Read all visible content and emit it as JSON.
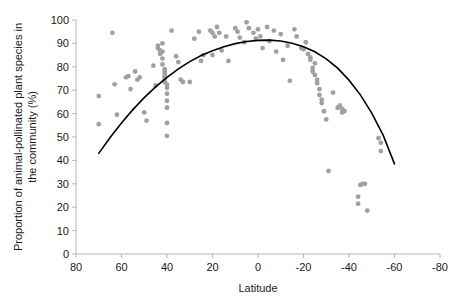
{
  "chart_data": {
    "type": "scatter",
    "title": "",
    "xlabel": "Latitude",
    "ylabel": "Proportion of animal-pollinated plant species in the community (%)",
    "ylabel_line1": "Proportion of animal-pollinated plant species in",
    "ylabel_line2": "the community (%)",
    "xlim": [
      80,
      -80
    ],
    "ylim": [
      0,
      100
    ],
    "xticks": [
      80,
      60,
      40,
      20,
      0,
      -20,
      -40,
      -60,
      -80
    ],
    "xtick_labels": [
      "80",
      "60",
      "40",
      "20",
      "0",
      "-20",
      "-40",
      "-60",
      "-80"
    ],
    "yticks": [
      0,
      10,
      20,
      30,
      40,
      50,
      60,
      70,
      80,
      90,
      100
    ],
    "ytick_labels": [
      "0",
      "10",
      "20",
      "30",
      "40",
      "50",
      "60",
      "70",
      "80",
      "90",
      "100"
    ],
    "grid": false,
    "legend": "none",
    "point_color": "#a0a0a0",
    "point_radius": 2.4,
    "axis_color": "#b5b5b5",
    "fit_color": "#000000",
    "fit_width": 1.6,
    "fit_type": "quadratic",
    "fit_note": "Fitted quadratic curve peaking near latitude 0 at about 93%",
    "fit_curve": [
      [
        70,
        43.0
      ],
      [
        65,
        49.8
      ],
      [
        60,
        56.0
      ],
      [
        55,
        61.7
      ],
      [
        50,
        66.8
      ],
      [
        45,
        71.4
      ],
      [
        40,
        75.5
      ],
      [
        35,
        79.1
      ],
      [
        30,
        82.2
      ],
      [
        25,
        84.8
      ],
      [
        20,
        86.9
      ],
      [
        15,
        88.6
      ],
      [
        10,
        89.9
      ],
      [
        5,
        90.8
      ],
      [
        0,
        91.3
      ],
      [
        -5,
        91.4
      ],
      [
        -10,
        91.0
      ],
      [
        -15,
        90.1
      ],
      [
        -20,
        88.6
      ],
      [
        -25,
        86.4
      ],
      [
        -30,
        83.4
      ],
      [
        -35,
        79.4
      ],
      [
        -40,
        74.3
      ],
      [
        -45,
        68.0
      ],
      [
        -50,
        60.2
      ],
      [
        -55,
        50.8
      ],
      [
        -60,
        38.5
      ]
    ],
    "series": [
      {
        "name": "Plant communities",
        "points": [
          [
            70,
            67.5
          ],
          [
            70,
            55.5
          ],
          [
            64,
            94.5
          ],
          [
            63,
            72.5
          ],
          [
            62,
            59.5
          ],
          [
            58,
            75.5
          ],
          [
            57,
            76.0
          ],
          [
            56,
            70.5
          ],
          [
            54,
            78.0
          ],
          [
            53,
            74.5
          ],
          [
            52,
            75.5
          ],
          [
            50,
            60.5
          ],
          [
            49,
            57.0
          ],
          [
            46,
            80.5
          ],
          [
            45,
            72.0
          ],
          [
            44,
            89.0
          ],
          [
            44,
            88.0
          ],
          [
            43,
            87.0
          ],
          [
            43,
            85.5
          ],
          [
            42,
            90.0
          ],
          [
            42,
            86.5
          ],
          [
            42,
            83.5
          ],
          [
            42,
            81.0
          ],
          [
            41,
            79.0
          ],
          [
            41,
            78.0
          ],
          [
            41,
            77.0
          ],
          [
            41,
            76.0
          ],
          [
            41,
            75.5
          ],
          [
            41,
            74.5
          ],
          [
            41,
            73.5
          ],
          [
            40,
            72.5
          ],
          [
            40,
            71.0
          ],
          [
            40,
            68.5
          ],
          [
            40,
            65.5
          ],
          [
            40,
            62.5
          ],
          [
            40,
            56.0
          ],
          [
            40,
            50.5
          ],
          [
            38,
            95.5
          ],
          [
            36,
            84.5
          ],
          [
            35,
            82.0
          ],
          [
            34,
            74.5
          ],
          [
            33,
            73.5
          ],
          [
            30,
            73.5
          ],
          [
            28,
            92.0
          ],
          [
            26,
            95.0
          ],
          [
            25,
            82.5
          ],
          [
            24,
            85.0
          ],
          [
            21,
            95.5
          ],
          [
            20,
            94.5
          ],
          [
            20,
            85.0
          ],
          [
            19,
            93.0
          ],
          [
            18,
            97.0
          ],
          [
            17,
            94.5
          ],
          [
            16,
            87.0
          ],
          [
            14,
            93.0
          ],
          [
            13,
            82.5
          ],
          [
            10,
            96.5
          ],
          [
            9,
            95.0
          ],
          [
            8,
            92.5
          ],
          [
            6,
            90.5
          ],
          [
            5,
            99.0
          ],
          [
            4,
            96.5
          ],
          [
            2,
            94.5
          ],
          [
            1,
            92.0
          ],
          [
            0,
            96.0
          ],
          [
            -1,
            93.0
          ],
          [
            -2,
            88.0
          ],
          [
            -4,
            97.0
          ],
          [
            -5,
            91.0
          ],
          [
            -7,
            95.5
          ],
          [
            -8,
            86.5
          ],
          [
            -10,
            94.0
          ],
          [
            -11,
            83.0
          ],
          [
            -13,
            89.0
          ],
          [
            -14,
            74.0
          ],
          [
            -16,
            96.0
          ],
          [
            -17,
            93.0
          ],
          [
            -19,
            88.0
          ],
          [
            -20,
            87.5
          ],
          [
            -21,
            90.5
          ],
          [
            -22,
            85.5
          ],
          [
            -23,
            84.0
          ],
          [
            -23,
            83.0
          ],
          [
            -24,
            79.5
          ],
          [
            -24,
            78.0
          ],
          [
            -25,
            81.5
          ],
          [
            -25,
            76.5
          ],
          [
            -26,
            74.5
          ],
          [
            -26,
            73.0
          ],
          [
            -27,
            70.5
          ],
          [
            -27,
            68.0
          ],
          [
            -28,
            66.0
          ],
          [
            -28,
            64.5
          ],
          [
            -29,
            61.0
          ],
          [
            -30,
            57.5
          ],
          [
            -31,
            35.5
          ],
          [
            -33,
            69.0
          ],
          [
            -35,
            62.5
          ],
          [
            -36,
            63.5
          ],
          [
            -37,
            62.0
          ],
          [
            -37,
            60.5
          ],
          [
            -38,
            61.0
          ],
          [
            -45,
            29.5
          ],
          [
            -46,
            30.0
          ],
          [
            -47,
            30.0
          ],
          [
            -44,
            24.5
          ],
          [
            -44,
            21.5
          ],
          [
            -48,
            18.5
          ],
          [
            -53,
            49.5
          ],
          [
            -54,
            47.5
          ],
          [
            -54,
            44.0
          ]
        ]
      }
    ]
  }
}
